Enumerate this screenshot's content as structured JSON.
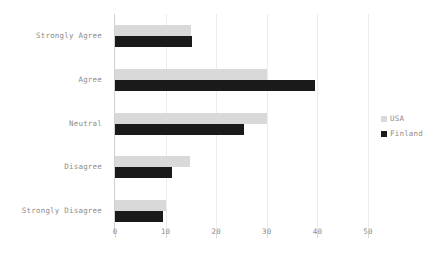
{
  "chart_data": {
    "type": "bar",
    "orientation": "horizontal",
    "title": "",
    "xlabel": "",
    "ylabel": "",
    "categories": [
      "Strongly Agree",
      "Agree",
      "Neutral",
      "Disagree",
      "Strongly Disagree"
    ],
    "series": [
      {
        "name": "USA",
        "color": "#d9d9d9",
        "values": [
          15,
          30,
          30,
          14.8,
          10
        ]
      },
      {
        "name": "Finland",
        "color": "#1a1a1a",
        "values": [
          15.2,
          39.5,
          25.5,
          11.3,
          9.5
        ]
      }
    ],
    "xlim": [
      0,
      50
    ],
    "xticks": [
      0,
      10,
      20,
      30,
      40,
      50
    ],
    "xtick_labels": [
      "0",
      "10",
      "20",
      "30",
      "40",
      "50"
    ],
    "grid": true,
    "grid_axis": "x",
    "legend_position": "right",
    "legend_entries": [
      "USA",
      "Finland"
    ]
  },
  "colors": {
    "usa": "#d9d9d9",
    "finland": "#1a1a1a",
    "grid": "#ececec",
    "axis": "#d0d0d0",
    "text": "#8c8c8c",
    "background": "#ffffff"
  }
}
